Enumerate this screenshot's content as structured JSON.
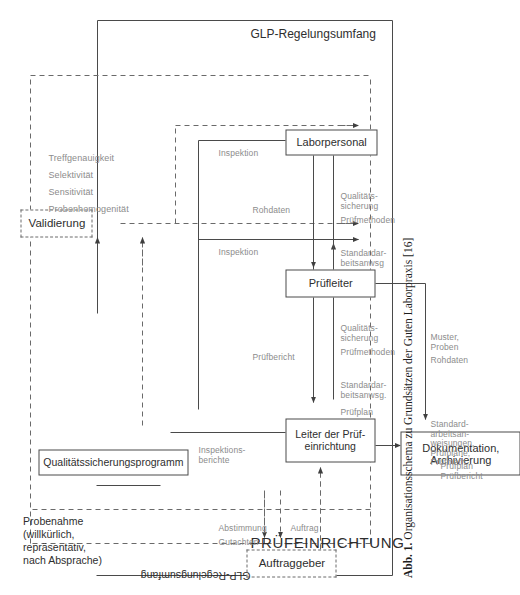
{
  "figure": {
    "caption_prefix": "Abb. 1.",
    "caption_text": "Organisationsschema zu Grundsätzen der Guten Laborpraxis [16]"
  },
  "scope": {
    "outer_label": "GLP-Regelungsumfang",
    "inner_label": "GLP-Regelungsumfang"
  },
  "sections": {
    "pruefeinrichtung": "PRÜFEINRICHTUNG"
  },
  "boxes": {
    "auftraggeber": "Auftraggeber",
    "probenahme": "Probenahme\n(willkürlich,\nrepräsentativ,\nnach Absprache)",
    "qualitaetssicherungsprogramm": "Qualitätssicherungsprogramm",
    "validierung": "Validierung",
    "leiter": "Leiter der Prüf-\neinrichtung",
    "pruefleiter": "Prüfleiter",
    "laborpersonal": "Laborpersonal",
    "dokumentation": "Dokumentation,\nArchivierung"
  },
  "validierung_attributes": [
    "Probenhomogenität",
    "Sensitivität",
    "Selektivität",
    "Treffgenauigkeit"
  ],
  "edge_labels": {
    "gutachten": "Gutachten",
    "abstimmung": "Abstimmung",
    "auftrag": "Auftrag",
    "inspektionsberichte": "Inspektions-\nberichte",
    "inspektion_1": "Inspektion",
    "inspektion_2": "Inspektion",
    "pruefbericht_leiter": "Prüfbericht",
    "pruefplan": "Prüfplan",
    "standardarbeitsanwsg_1": "Standardar-\nbeitsanwsg.",
    "pruefmethoden_1": "Prüfmethoden",
    "qualitaetssicherung_1": "Qualitäts-\nsicherung",
    "rohdaten_lab": "Rohdaten",
    "standardarbeitsanwsg_2": "Standardar-\nbeitsanwsg",
    "pruefmethoden_2": "Prüfmethoden",
    "qualitaetssicherung_2": "Qualitäts-\nsicherung",
    "pruefplan_pruefbericht": "Prüfplan\nPrüfbericht",
    "standardarbeitsanweisungen": "Standard-\narbeitsan-\nweisungen,\nPrüfpläne,\nPrüfmeth..",
    "rohdaten_dok": "Rohdaten",
    "muster_proben": "Muster,\nProben"
  },
  "colors": {
    "line": "#4a4a4a",
    "line_light": "#8c8c8c",
    "text": "#2e2e2e",
    "background": "#ffffff"
  }
}
